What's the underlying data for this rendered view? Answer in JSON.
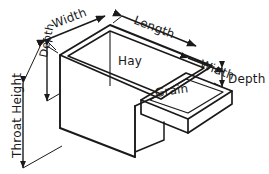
{
  "diagram": {
    "background_color": "#ffffff",
    "line_color": "#1a1a1a",
    "text_color": "#1a1a1a",
    "labels": {
      "width_left": "Width",
      "length_top": "Length",
      "width_right": "Width",
      "depth_left": "Depth",
      "depth_right": "Depth",
      "throat_height": "Throat Height",
      "hay": "Hay",
      "grain": "Grain"
    }
  }
}
